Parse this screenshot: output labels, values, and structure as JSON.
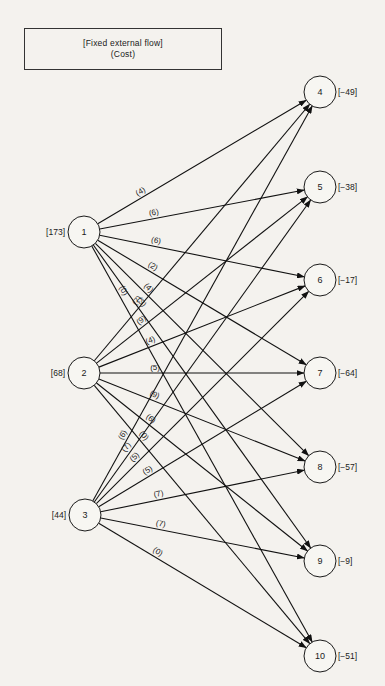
{
  "legend": {
    "line1": "[Fixed external flow]",
    "line2": "(Cost)"
  },
  "nodes": [
    {
      "id": "1",
      "x": 84,
      "y": 232,
      "flow": "[173]",
      "side": "left"
    },
    {
      "id": "2",
      "x": 84,
      "y": 373,
      "flow": "[68]",
      "side": "left"
    },
    {
      "id": "3",
      "x": 85,
      "y": 515,
      "flow": "[44]",
      "side": "left"
    },
    {
      "id": "4",
      "x": 320,
      "y": 92,
      "flow": "[−49]",
      "side": "right"
    },
    {
      "id": "5",
      "x": 320,
      "y": 187,
      "flow": "[−38]",
      "side": "right"
    },
    {
      "id": "6",
      "x": 320,
      "y": 280,
      "flow": "[−17]",
      "side": "right"
    },
    {
      "id": "7",
      "x": 320,
      "y": 373,
      "flow": "[−64]",
      "side": "right"
    },
    {
      "id": "8",
      "x": 320,
      "y": 467,
      "flow": "[−57]",
      "side": "right"
    },
    {
      "id": "9",
      "x": 320,
      "y": 561,
      "flow": "[−9]",
      "side": "right"
    },
    {
      "id": "10",
      "x": 320,
      "y": 656,
      "flow": "[−51]",
      "side": "right"
    }
  ],
  "edges": [
    {
      "from": "1",
      "to": "4",
      "cost": "(4)",
      "t": 0.22
    },
    {
      "from": "1",
      "to": "5",
      "cost": "(6)",
      "t": 0.27
    },
    {
      "from": "1",
      "to": "6",
      "cost": "(6)",
      "t": 0.27
    },
    {
      "from": "1",
      "to": "7",
      "cost": "(2)",
      "t": 0.25
    },
    {
      "from": "1",
      "to": "8",
      "cost": "(4)",
      "t": 0.23
    },
    {
      "from": "1",
      "to": "9",
      "cost": "(3)",
      "t": 0.2
    },
    {
      "from": "1",
      "to": "10",
      "cost": "(0)",
      "t": 0.12
    },
    {
      "from": "2",
      "to": "4",
      "cost": "(7)",
      "t": 0.22
    },
    {
      "from": "2",
      "to": "5",
      "cost": "(9)",
      "t": 0.23
    },
    {
      "from": "2",
      "to": "6",
      "cost": "(4)",
      "t": 0.26
    },
    {
      "from": "2",
      "to": "7",
      "cost": "(5)",
      "t": 0.27
    },
    {
      "from": "2",
      "to": "8",
      "cost": "(9)",
      "t": 0.26
    },
    {
      "from": "2",
      "to": "9",
      "cost": "(6)",
      "t": 0.24
    },
    {
      "from": "2",
      "to": "10",
      "cost": "(0)",
      "t": 0.21
    },
    {
      "from": "3",
      "to": "4",
      "cost": "(6)",
      "t": 0.16
    },
    {
      "from": "3",
      "to": "5",
      "cost": "(7)",
      "t": 0.17
    },
    {
      "from": "3",
      "to": "6",
      "cost": "(5)",
      "t": 0.2
    },
    {
      "from": "3",
      "to": "7",
      "cost": "(5)",
      "t": 0.25
    },
    {
      "from": "3",
      "to": "8",
      "cost": "(7)",
      "t": 0.29
    },
    {
      "from": "3",
      "to": "9",
      "cost": "(7)",
      "t": 0.29
    },
    {
      "from": "3",
      "to": "10",
      "cost": "(0)",
      "t": 0.27
    }
  ]
}
